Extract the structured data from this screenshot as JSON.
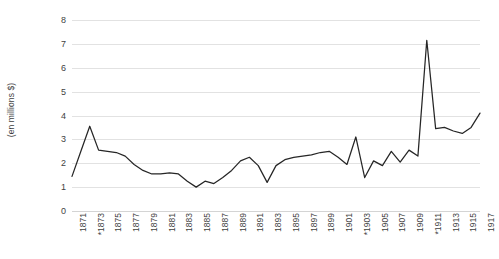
{
  "chart_data": {
    "type": "line",
    "title": "",
    "subtitle": "",
    "xlabel": "",
    "ylabel": "(en millions $)",
    "ylim": [
      0,
      8
    ],
    "yticks": [
      0,
      1,
      2,
      3,
      4,
      5,
      6,
      7,
      8
    ],
    "ytick_labels": [
      "0",
      "1",
      "2",
      "3",
      "4",
      "5",
      "6",
      "7",
      "8"
    ],
    "xlim": [
      1871,
      1917
    ],
    "grid": true,
    "legend": false,
    "legend_position": "none",
    "series_color": "#262626",
    "gridline_color": "#e2e2e2",
    "background": "#ffffff",
    "xtick_labels": [
      "1871",
      "*1873",
      "1875",
      "1877",
      "1879",
      "1881",
      "1883",
      "1885",
      "1887",
      "1889",
      "1891",
      "1893",
      "1895",
      "1897",
      "1899",
      "1901",
      "*1903",
      "1905",
      "1907",
      "1909",
      "*1911",
      "1913",
      "1915",
      "1917"
    ],
    "x": [
      1871,
      1872,
      1873,
      1874,
      1875,
      1876,
      1877,
      1878,
      1879,
      1880,
      1881,
      1882,
      1883,
      1884,
      1885,
      1886,
      1887,
      1888,
      1889,
      1890,
      1891,
      1892,
      1893,
      1894,
      1895,
      1896,
      1897,
      1898,
      1899,
      1900,
      1901,
      1902,
      1903,
      1904,
      1905,
      1906,
      1907,
      1908,
      1909,
      1910,
      1911,
      1912,
      1913,
      1914,
      1915,
      1916,
      1917
    ],
    "values": [
      1.45,
      2.5,
      3.55,
      2.55,
      2.5,
      2.45,
      2.3,
      1.95,
      1.7,
      1.55,
      1.55,
      1.6,
      1.55,
      1.25,
      1.0,
      1.25,
      1.15,
      1.4,
      1.7,
      2.1,
      2.25,
      1.9,
      1.2,
      1.9,
      2.15,
      2.25,
      2.3,
      2.35,
      2.45,
      2.5,
      2.25,
      1.95,
      3.1,
      1.4,
      2.1,
      1.9,
      2.5,
      2.05,
      2.55,
      2.3,
      7.15,
      3.45,
      3.5,
      3.35,
      3.25,
      3.5,
      4.1
    ],
    "series": [
      {
        "name": "valeur",
        "values": [
          1.45,
          2.5,
          3.55,
          2.55,
          2.5,
          2.45,
          2.3,
          1.95,
          1.7,
          1.55,
          1.55,
          1.6,
          1.55,
          1.25,
          1.0,
          1.25,
          1.15,
          1.4,
          1.7,
          2.1,
          2.25,
          1.9,
          1.2,
          1.9,
          2.15,
          2.25,
          2.3,
          2.35,
          2.45,
          2.5,
          2.25,
          1.95,
          3.1,
          1.4,
          2.1,
          1.9,
          2.5,
          2.05,
          2.55,
          2.3,
          7.15,
          3.45,
          3.5,
          3.35,
          3.25,
          3.5,
          4.1
        ]
      }
    ],
    "annotations": [
      "Asterisks mark the years 1873, 1903 and 1911 on the horizontal axis."
    ]
  }
}
